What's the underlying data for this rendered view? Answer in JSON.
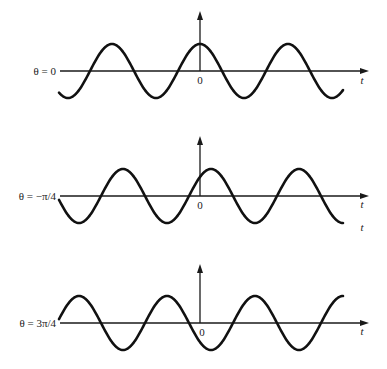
{
  "chart_data": {
    "type": "line",
    "title": "",
    "xlabel": "t",
    "ylabel": "",
    "period_px": 88,
    "amplitude_px": 27,
    "x_range_px": [
      59,
      343
    ],
    "panels": [
      {
        "label": "θ = 0",
        "phase": 0,
        "origin_label": "0",
        "t_label": "t",
        "axis_y": 71,
        "arrow_top": 12,
        "label_y": 75,
        "t_label_y": 84,
        "extra_t_label_y": null
      },
      {
        "label": "θ = −π/4",
        "phase": -0.7853981634,
        "origin_label": "0",
        "t_label": "t",
        "axis_y": 196,
        "arrow_top": 137,
        "label_y": 200,
        "t_label_y": 208,
        "extra_t_label_y": 231
      },
      {
        "label": "θ = 3π/4",
        "phase": 2.3561944902,
        "origin_label": "0",
        "t_label": "t",
        "axis_y": 323,
        "arrow_top": 265,
        "label_y": 327,
        "t_label_y": 335,
        "extra_t_label_y": null
      }
    ],
    "colors": {
      "line": "#111111",
      "axis": "#1a1a1a",
      "background": "#ffffff"
    }
  }
}
